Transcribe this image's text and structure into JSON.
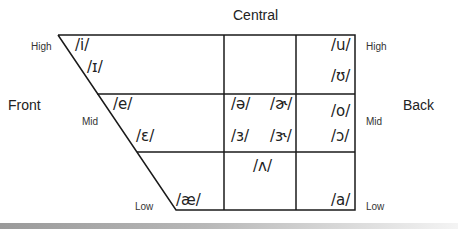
{
  "diagram": {
    "type": "vowel-chart",
    "axis_labels": {
      "front": "Front",
      "central": "Central",
      "back": "Back"
    },
    "height_labels_left": {
      "high": "High",
      "mid": "Mid",
      "low": "Low"
    },
    "height_labels_right": {
      "high": "High",
      "mid": "Mid",
      "low": "Low"
    },
    "vowels": {
      "i": "/i/",
      "ih": "/ɪ/",
      "e": "/e/",
      "eh": "/ɛ/",
      "ae": "/æ/",
      "schwa": "/ə/",
      "schwar": "/ɚ/",
      "er": "/ɜ/",
      "err": "/ɝ/",
      "wedge": "/ʌ/",
      "u": "/u/",
      "uh": "/ʊ/",
      "o": "/o/",
      "openo": "/ɔ/",
      "a": "/a/"
    },
    "colors": {
      "line": "#1a1a1a",
      "text": "#222222",
      "background": "#ffffff"
    }
  }
}
